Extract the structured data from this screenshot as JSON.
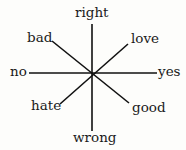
{
  "diagram": {
    "type": "radial-axes",
    "center": [
      92,
      73
    ],
    "line_color": "#111111",
    "labels": {
      "top": "right",
      "top_left": "bad",
      "top_right": "love",
      "left": "no",
      "right": "yes",
      "bottom_left": "hate",
      "bottom_right": "good",
      "bottom": "wrong"
    },
    "axes": [
      {
        "from": "right",
        "to": "wrong"
      },
      {
        "from": "no",
        "to": "yes"
      },
      {
        "from": "bad",
        "to": "good"
      },
      {
        "from": "love",
        "to": "hate"
      }
    ]
  }
}
